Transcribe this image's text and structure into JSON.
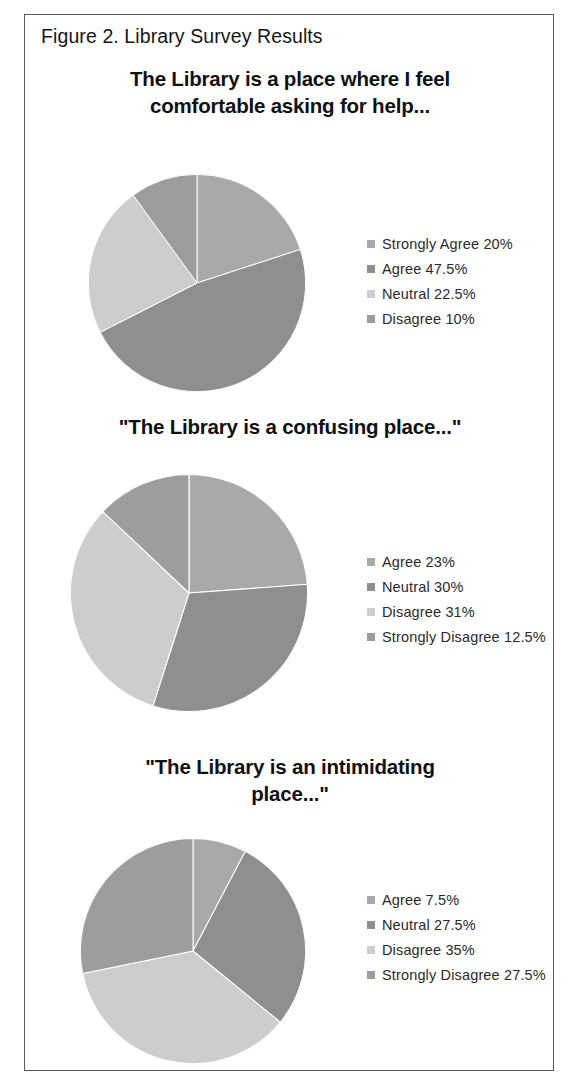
{
  "figure": {
    "caption": "Figure 2. Library Survey Results",
    "border_color": "#5a5a5a"
  },
  "palette": {
    "strongly_agree": "#a9a9a9",
    "agree": "#8f8f8f",
    "neutral": "#c9c9c9",
    "disagree": "#9a9a9a",
    "light": "#cdcdcd",
    "mid": "#8c8c8c"
  },
  "chart_data": [
    {
      "type": "pie",
      "title": "The Library is a place where I feel comfortable asking for help...",
      "title_lines": [
        "The Library is a place where I feel",
        "comfortable asking for help..."
      ],
      "categories": [
        "Strongly Agree",
        "Agree",
        "Neutral",
        "Disagree"
      ],
      "values": [
        20,
        47.5,
        22.5,
        10
      ],
      "legend_labels": [
        "Strongly Agree 20%",
        "Agree 47.5%",
        "Neutral 22.5%",
        "Disagree 10%"
      ],
      "colors": [
        "#a9a9a9",
        "#8f8f8f",
        "#cdcdcd",
        "#9d9d9d"
      ],
      "legend_position": "right",
      "start_angle": 0
    },
    {
      "type": "pie",
      "title": "\"The Library is a confusing place...\"",
      "title_lines": [
        "\"The Library is a confusing place...\""
      ],
      "categories": [
        "Agree",
        "Neutral",
        "Disagree",
        "Strongly Disagree"
      ],
      "values": [
        23,
        30,
        31,
        12.5
      ],
      "legend_labels": [
        "Agree 23%",
        "Neutral 30%",
        "Disagree 31%",
        "Strongly Disagree 12.5%"
      ],
      "colors": [
        "#a9a9a9",
        "#8f8f8f",
        "#cdcdcd",
        "#9d9d9d"
      ],
      "legend_position": "right",
      "start_angle": 0
    },
    {
      "type": "pie",
      "title": "\"The Library is an intimidating place...\"",
      "title_lines": [
        "\"The Library is an intimidating",
        "place...\""
      ],
      "categories": [
        "Agree",
        "Neutral",
        "Disagree",
        "Strongly Disagree"
      ],
      "values": [
        7.5,
        27.5,
        35,
        27.5
      ],
      "legend_labels": [
        "Agree 7.5%",
        "Neutral 27.5%",
        "Disagree 35%",
        "Strongly Disagree 27.5%"
      ],
      "colors": [
        "#a9a9a9",
        "#8f8f8f",
        "#cdcdcd",
        "#9d9d9d"
      ],
      "legend_position": "right",
      "start_angle": 0
    }
  ],
  "layout": {
    "charts": [
      {
        "title_top": 50,
        "body_top": 130,
        "pie_left": 62,
        "pie_top": 28,
        "pie_size": 220,
        "legend_left": 342,
        "legend_top": 86
      },
      {
        "title_top": 398,
        "body_top": 430,
        "pie_left": 44,
        "pie_top": 28,
        "pie_size": 240,
        "legend_left": 342,
        "legend_top": 104
      },
      {
        "title_top": 738,
        "body_top": 800,
        "pie_left": 54,
        "pie_top": 22,
        "pie_size": 228,
        "legend_left": 342,
        "legend_top": 72
      }
    ]
  }
}
